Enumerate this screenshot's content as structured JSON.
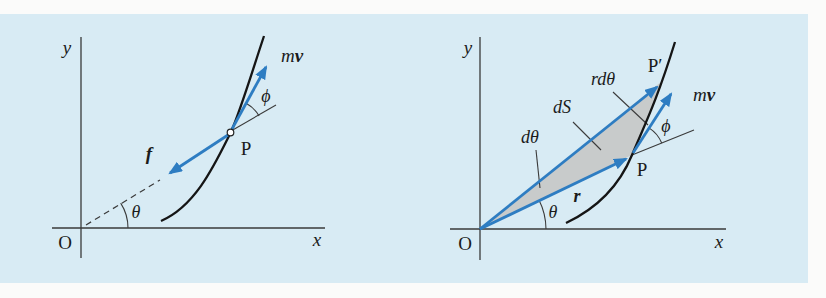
{
  "figure": {
    "type": "physics-diagram",
    "colors": {
      "page_background": "#fbfbfa",
      "panel_background": "#d8ebf4",
      "vector_blue": "#2e7dc2",
      "area_shade_gray": "#c8cbcb",
      "line_black": "#3a3a3a",
      "curve_black": "#151515"
    },
    "left_panel": {
      "axis_labels": {
        "x": "x",
        "y": "y"
      },
      "origin_label": "O",
      "point_label": "P",
      "momentum_label": {
        "m": "m",
        "v": "v"
      },
      "force_label": "f",
      "angle_theta": "θ",
      "angle_phi": "ϕ"
    },
    "right_panel": {
      "axis_labels": {
        "x": "x",
        "y": "y"
      },
      "origin_label": "O",
      "point_label": "P",
      "point_prime_label": "P′",
      "momentum_label": {
        "m": "m",
        "v": "v"
      },
      "radius_label": "r",
      "angle_theta": "θ",
      "angle_phi": "ϕ",
      "d_theta": "dθ",
      "area_element": "dS",
      "arc_length": "rdθ"
    }
  }
}
